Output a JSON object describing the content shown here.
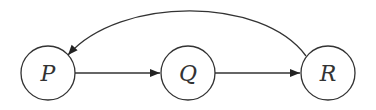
{
  "diagram": {
    "type": "directed-graph",
    "nodes": [
      {
        "id": "P",
        "label": "P",
        "cx": 48,
        "cy": 73,
        "r": 27
      },
      {
        "id": "Q",
        "label": "Q",
        "cx": 188,
        "cy": 73,
        "r": 27
      },
      {
        "id": "R",
        "label": "R",
        "cx": 328,
        "cy": 73,
        "r": 27
      }
    ],
    "edges": [
      {
        "from": "P",
        "to": "Q",
        "shape": "straight"
      },
      {
        "from": "Q",
        "to": "R",
        "shape": "straight"
      },
      {
        "from": "R",
        "to": "P",
        "shape": "arc-over-top"
      }
    ],
    "colors": {
      "stroke": "#333333",
      "fill": "#ffffff",
      "background": "#ffffff"
    }
  }
}
